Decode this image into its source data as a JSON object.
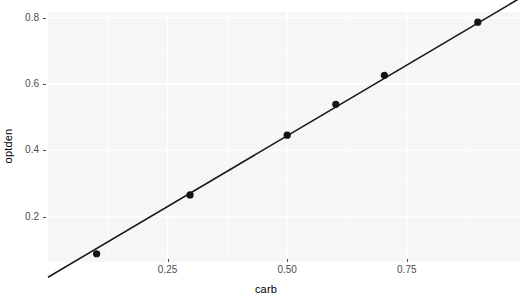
{
  "chart_data": {
    "type": "scatter",
    "title": "",
    "xlabel": "carb",
    "ylabel": "optden",
    "xlim": [
      0.0,
      0.9866
    ],
    "ylim": [
      0.0642,
      0.8167
    ],
    "xticks": [
      0.25,
      0.5,
      0.75
    ],
    "xtick_labels": [
      "0.25",
      "0.50",
      "0.75"
    ],
    "yticks": [
      0.2,
      0.4,
      0.6,
      0.8
    ],
    "ytick_labels": [
      "0.2",
      "0.4",
      "0.6",
      "0.8"
    ],
    "grid": true,
    "legend": "none",
    "points": [
      {
        "x": 0.1016,
        "y": 0.089
      },
      {
        "x": 0.2969,
        "y": 0.266
      },
      {
        "x": 0.5,
        "y": 0.446
      },
      {
        "x": 0.6016,
        "y": 0.539
      },
      {
        "x": 0.7031,
        "y": 0.626
      },
      {
        "x": 0.8984,
        "y": 0.786
      }
    ],
    "series": [
      {
        "name": "optden vs carb",
        "x": [
          0.1016,
          0.2969,
          0.5,
          0.6016,
          0.7031,
          0.8984
        ],
        "values": [
          0.089,
          0.266,
          0.446,
          0.539,
          0.626,
          0.786
        ]
      }
    ],
    "fit_line": {
      "type": "linear",
      "x_start": 0.0,
      "y_start": 0.0183,
      "x_end": 0.9866,
      "y_end": 0.8584,
      "slope": 0.8515,
      "intercept": 0.0183,
      "color": "#1a1a1a"
    },
    "point_color": "#141414",
    "point_size": 4.4,
    "panel_bg": "#f6f6f7",
    "grid_color": "#ffffff",
    "text_color": "#4d4d4d"
  }
}
